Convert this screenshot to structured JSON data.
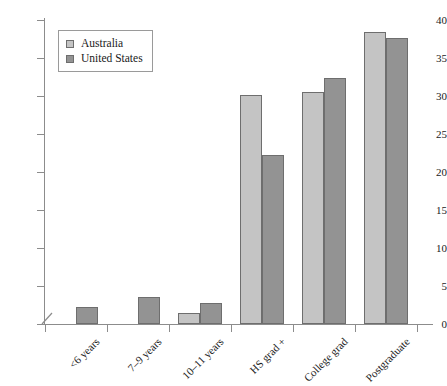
{
  "chart_data": {
    "type": "bar",
    "title": "",
    "subtitle": "",
    "xlabel": "",
    "ylabel": "",
    "ylim": [
      0,
      40
    ],
    "yticks": [
      0,
      5,
      10,
      15,
      20,
      25,
      30,
      35,
      40
    ],
    "grid": false,
    "legend_position": "top-left",
    "axis_break": true,
    "categories": [
      "<6 years",
      "7–9 years",
      "10–11 years",
      "HS grad +",
      "College grad",
      "Postgraduate"
    ],
    "series": [
      {
        "name": "Australia",
        "color": "#c4c4c4",
        "values": [
          0,
          0,
          1.4,
          30.1,
          30.5,
          38.4
        ]
      },
      {
        "name": "United States",
        "color": "#939393",
        "values": [
          2.2,
          3.5,
          2.8,
          22.3,
          32.4,
          37.6
        ]
      }
    ]
  },
  "legend": {
    "items": [
      {
        "label": "Australia",
        "swatch": "light-gray-square"
      },
      {
        "label": "United States",
        "swatch": "dark-gray-square"
      }
    ]
  },
  "colors": {
    "series_australia": "#c4c4c4",
    "series_united_states": "#939393",
    "bar_border": "#6e6e6e",
    "axis": "#8c8c8c",
    "text": "#1a1a1a",
    "background": "#ffffff"
  }
}
